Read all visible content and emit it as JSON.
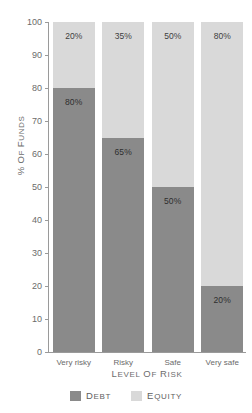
{
  "chart_data": {
    "type": "bar",
    "stacked": true,
    "title": "",
    "xlabel": "Level of Risk",
    "ylabel": "% of Funds",
    "categories": [
      "Very risky",
      "Risky",
      "Safe",
      "Very safe"
    ],
    "series": [
      {
        "name": "Debt",
        "color": "#8a8a8a",
        "values": [
          80,
          65,
          50,
          20
        ]
      },
      {
        "name": "Equity",
        "color": "#d9d9d9",
        "values": [
          20,
          35,
          50,
          80
        ]
      }
    ],
    "ylim": [
      0,
      100
    ],
    "yticks": [
      "0",
      "10",
      "20",
      "30",
      "40",
      "50",
      "60",
      "70",
      "80",
      "90",
      "100"
    ],
    "grid": false,
    "legend_position": "bottom",
    "data_labels": {
      "debt": [
        "80%",
        "65%",
        "50%",
        "20%"
      ],
      "equity": [
        "20%",
        "35%",
        "50%",
        "80%"
      ]
    }
  },
  "legend": {
    "items": [
      {
        "label": "Debt",
        "color": "#8a8a8a"
      },
      {
        "label": "Equity",
        "color": "#d9d9d9"
      }
    ]
  }
}
